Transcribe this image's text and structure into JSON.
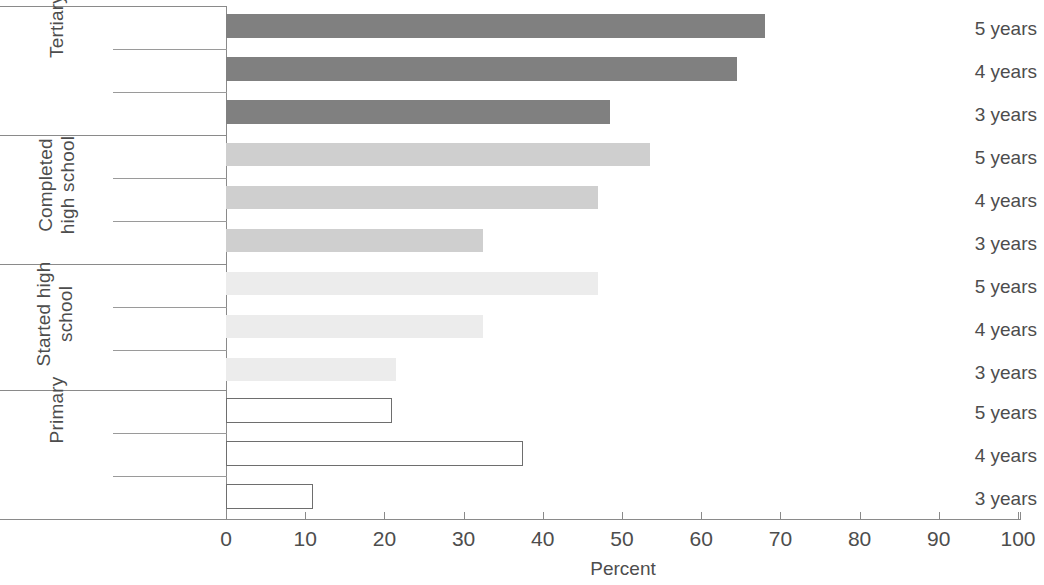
{
  "chart_data": {
    "type": "bar",
    "orientation": "horizontal",
    "title": "",
    "xlabel": "Percent",
    "ylabel": "",
    "xlim": [
      0,
      100
    ],
    "xticks": [
      0,
      10,
      20,
      30,
      40,
      50,
      60,
      70,
      80,
      90,
      100
    ],
    "grid": false,
    "legend": null,
    "groups": [
      {
        "name": "Tertiary",
        "color": "#808080",
        "style": "filled",
        "categories": [
          "5 years",
          "4 years",
          "3 years"
        ],
        "values": [
          68,
          64.5,
          48.5
        ]
      },
      {
        "name": "Completed high school",
        "color": "#cfcfcf",
        "style": "filled",
        "categories": [
          "5 years",
          "4 years",
          "3 years"
        ],
        "values": [
          53.5,
          47,
          32.5
        ]
      },
      {
        "name": "Started high school",
        "color": "#ececec",
        "style": "filled",
        "categories": [
          "5 years",
          "4 years",
          "3 years"
        ],
        "values": [
          47,
          32.5,
          21.5
        ]
      },
      {
        "name": "Primary",
        "color": "#ffffff",
        "style": "outlined",
        "categories": [
          "5 years",
          "4 years",
          "3 years"
        ],
        "values": [
          21,
          37.5,
          11
        ]
      }
    ]
  },
  "axis": {
    "title": "Percent",
    "tick_labels": [
      "0",
      "10",
      "20",
      "30",
      "40",
      "50",
      "60",
      "70",
      "80",
      "90",
      "100"
    ]
  },
  "groups": {
    "tertiary": {
      "label": "Tertiary"
    },
    "completed_high_school": {
      "label": "Completed high school"
    },
    "started_high_school": {
      "label": "Started high school"
    },
    "primary": {
      "label": "Primary"
    }
  },
  "rows": {
    "r0": {
      "label": "5 years"
    },
    "r1": {
      "label": "4 years"
    },
    "r2": {
      "label": "3 years"
    },
    "r3": {
      "label": "5 years"
    },
    "r4": {
      "label": "4 years"
    },
    "r5": {
      "label": "3 years"
    },
    "r6": {
      "label": "5 years"
    },
    "r7": {
      "label": "4 years"
    },
    "r8": {
      "label": "3 years"
    },
    "r9": {
      "label": "5 years"
    },
    "r10": {
      "label": "4 years"
    },
    "r11": {
      "label": "3 years"
    }
  },
  "colors": {
    "tertiary_bar": "#808080",
    "completed_bar": "#cfcfcf",
    "started_bar": "#ececec",
    "primary_bar_outline": "#6e6e6e",
    "rule": "#8a8a8a",
    "text": "#4d4d4d",
    "background": "#ffffff"
  }
}
